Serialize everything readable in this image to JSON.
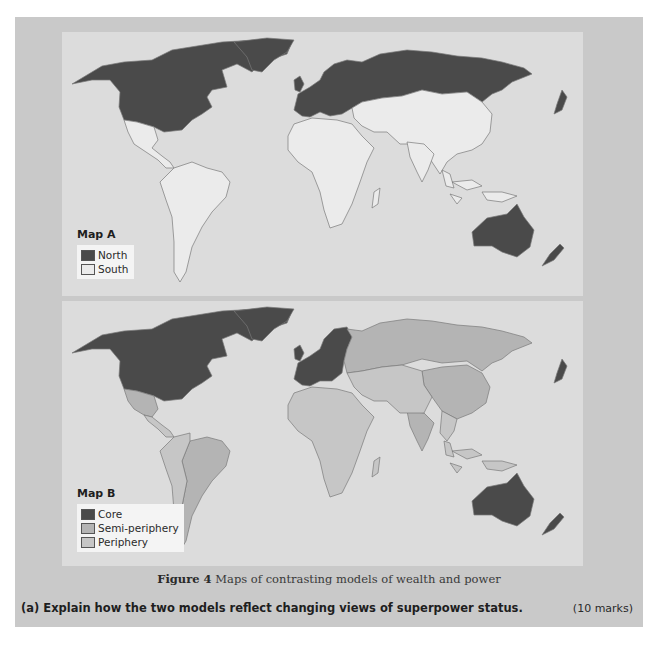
{
  "figure": {
    "number_label": "Figure 4",
    "caption": "Maps of contrasting models of wealth and power"
  },
  "map_a": {
    "title": "Map A",
    "legend": [
      {
        "label": "North",
        "color": "#4a4a4a"
      },
      {
        "label": "South",
        "color": "#ebebeb"
      }
    ],
    "regions": {
      "North": [
        "North America (USA, Canada)",
        "Greenland",
        "Europe",
        "Russia",
        "Japan",
        "Australia",
        "New Zealand"
      ],
      "South": [
        "Latin America",
        "Africa",
        "Middle East",
        "South Asia",
        "East Asia (China)",
        "Southeast Asia"
      ]
    }
  },
  "map_b": {
    "title": "Map B",
    "legend": [
      {
        "label": "Core",
        "color": "#4a4a4a"
      },
      {
        "label": "Semi-periphery",
        "color": "#b4b4b4"
      },
      {
        "label": "Periphery",
        "color": "#c6c6c6"
      }
    ],
    "regions": {
      "Core": [
        "USA",
        "Canada",
        "Greenland",
        "Western Europe",
        "Japan",
        "Australia",
        "New Zealand"
      ],
      "Semi-periphery": [
        "Mexico",
        "Brazil",
        "Argentina",
        "Russia",
        "China",
        "India",
        "South Africa"
      ],
      "Periphery": [
        "Central America",
        "rest of South America",
        "most of Africa",
        "Middle East",
        "Central Asia",
        "Southeast Asia"
      ]
    }
  },
  "question": {
    "text": "(a) Explain how the two models reflect changing views of superpower status.",
    "marks": "(10 marks)"
  },
  "colors": {
    "frame": "#c9c9c9",
    "panel": "#dcdcdc",
    "dark": "#4a4a4a",
    "light": "#ebebeb",
    "semi": "#b4b4b4",
    "periphery": "#c6c6c6"
  }
}
